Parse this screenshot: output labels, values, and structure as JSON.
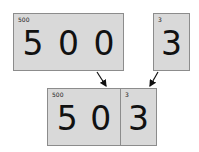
{
  "diagram": {
    "top_left": {
      "label": "500",
      "digits": "5 0 0"
    },
    "top_right": {
      "label": "3",
      "digits": "3"
    },
    "bottom_left": {
      "label": "500",
      "digits": "5 0"
    },
    "bottom_right": {
      "label": "3",
      "digits": "3"
    }
  },
  "colors": {
    "box_fill": "#d9d9d9",
    "box_border": "#8c8c8c",
    "arrow": "#111111"
  }
}
